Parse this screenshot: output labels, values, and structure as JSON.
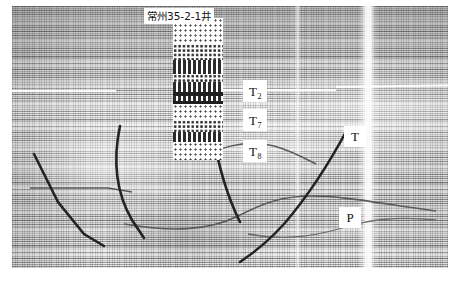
{
  "figure": {
    "kind": "seismic-reflection-section",
    "colors": {
      "background": "#ffffff",
      "seismic_base": "#d9d9d9",
      "pick_line": "#2b2b2b",
      "horizon_line": "#4a4a4a",
      "bright_horizon": "#ffffff",
      "label_box": "#ffffff",
      "label_text": "#111111"
    }
  },
  "well": {
    "label": "常州35-2-1井",
    "track_name": "lithology-log"
  },
  "horizon_labels": [
    {
      "name": "T2",
      "base": "T",
      "sub": "2"
    },
    {
      "name": "T7",
      "base": "T",
      "sub": "7"
    },
    {
      "name": "T8",
      "base": "T",
      "sub": "8"
    }
  ],
  "side_labels": [
    {
      "name": "T",
      "text": "T"
    },
    {
      "name": "P",
      "text": "P"
    }
  ],
  "caption": {
    "left_fragment": "",
    "right_fragment": ""
  }
}
